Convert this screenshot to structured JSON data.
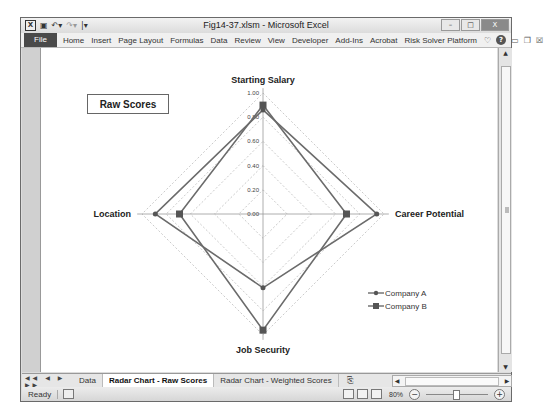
{
  "window": {
    "title": "Fig14-37.xlsm - Microsoft Excel",
    "quick_access": [
      "excel-logo-icon",
      "save-icon",
      "undo-icon",
      "redo-icon",
      "customize-icon"
    ],
    "controls": {
      "minimize": "–",
      "maximize": "□",
      "close": "X"
    }
  },
  "ribbon": {
    "file_label": "File",
    "tabs": [
      "Home",
      "Insert",
      "Page Layout",
      "Formulas",
      "Data",
      "Review",
      "View",
      "Developer",
      "Add-Ins",
      "Acrobat",
      "Risk Solver Platform"
    ],
    "right_icons": {
      "heart": "♡",
      "help": "?",
      "minimize_ribbon": "▭",
      "restore": "❐",
      "close": "☒"
    }
  },
  "sheet": {
    "textbox_label": "Raw Scores"
  },
  "chart_data": {
    "type": "radar",
    "title": "",
    "categories": [
      "Starting Salary",
      "Career Potential",
      "Job Security",
      "Location"
    ],
    "series": [
      {
        "name": "Company A",
        "marker": "diamond",
        "values": [
          0.86,
          0.94,
          0.61,
          0.89
        ]
      },
      {
        "name": "Company B",
        "marker": "square",
        "values": [
          0.9,
          0.69,
          0.96,
          0.69
        ]
      }
    ],
    "radial_ticks": [
      "0.00",
      "0.20",
      "0.40",
      "0.60",
      "0.80",
      "1.00"
    ],
    "rlim": [
      0,
      1
    ],
    "grid": true,
    "legend_position": "right-bottom",
    "colors": {
      "series": "#6b6b6b",
      "grid": "#bdbdbd",
      "axis": "#999999"
    }
  },
  "sheet_tabs": {
    "nav": "◀◀ ◀ ▶ ▶▶",
    "tabs": [
      {
        "label": "Data",
        "active": false
      },
      {
        "label": "Radar Chart - Raw Scores",
        "active": true
      },
      {
        "label": "Radar Chart - Weighted Scores",
        "active": false
      }
    ],
    "new_sheet": "⎘"
  },
  "status_bar": {
    "status": "Ready",
    "zoom_level": "80%",
    "zoom_out": "−",
    "zoom_in": "+"
  }
}
